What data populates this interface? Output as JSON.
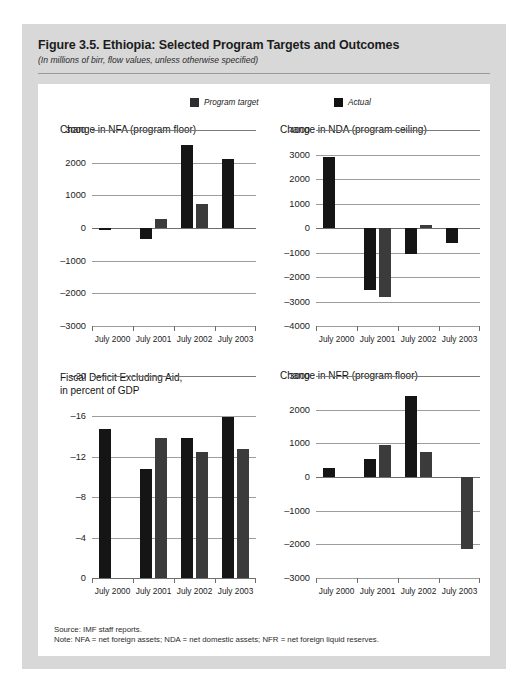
{
  "figure": {
    "title": "Figure 3.5. Ethiopia: Selected Program Targets and Outcomes",
    "subtitle": "(In millions of birr, flow values, unless otherwise specified)",
    "source_note": "Source: IMF staff reports.",
    "definition_note": "Note: NFA = net foreign assets; NDA = net domestic assets; NFR = net foreign liquid reserves."
  },
  "legend": {
    "target_label": "Program target",
    "actual_label": "Actual",
    "target_color": "#2e2e2e",
    "actual_color": "#111111"
  },
  "categories": [
    "July 2000",
    "July 2001",
    "July 2002",
    "July 2003"
  ],
  "chart_data": [
    {
      "id": "nfa",
      "type": "bar",
      "title": "Change in NFA (program floor)",
      "xlabel": "",
      "ylabel": "",
      "ylim": [
        -3000,
        3000
      ],
      "yticks": [
        3000,
        2000,
        1000,
        0,
        -1000,
        -2000,
        -3000
      ],
      "ytick_labels": [
        "3000",
        "2000",
        "1000",
        "0",
        "–1000",
        "–2000",
        "–3000"
      ],
      "grid": true,
      "legend_position": "top",
      "categories": [
        "July 2000",
        "July 2001",
        "July 2002",
        "July 2003"
      ],
      "series": [
        {
          "name": "Program target",
          "values": [
            -30,
            -330,
            2550,
            2100
          ]
        },
        {
          "name": "Actual",
          "values": [
            null,
            270,
            720,
            null
          ]
        }
      ]
    },
    {
      "id": "nda",
      "type": "bar",
      "title": "Change in NDA (program ceiling)",
      "xlabel": "",
      "ylabel": "",
      "ylim": [
        -4000,
        4000
      ],
      "yticks": [
        4000,
        3000,
        2000,
        1000,
        0,
        -1000,
        -2000,
        -3000,
        -4000
      ],
      "ytick_labels": [
        "4000",
        "3000",
        "2000",
        "1000",
        "0",
        "–1000",
        "–2000",
        "–3000",
        "–4000"
      ],
      "grid": true,
      "legend_position": "top",
      "categories": [
        "July 2000",
        "July 2001",
        "July 2002",
        "July 2003"
      ],
      "series": [
        {
          "name": "Program target",
          "values": [
            2880,
            -2520,
            -1050,
            -610
          ]
        },
        {
          "name": "Actual",
          "values": [
            null,
            -2800,
            110,
            null
          ]
        }
      ]
    },
    {
      "id": "fiscal-deficit",
      "type": "bar",
      "title": "Fiscal Deficit Excluding Aid,\nin percent of GDP",
      "xlabel": "",
      "ylabel": "",
      "ylim": [
        0,
        -20
      ],
      "yticks": [
        -20,
        -16,
        -12,
        -8,
        -4,
        0
      ],
      "ytick_labels": [
        "–20",
        "–16",
        "–12",
        "–8",
        "–4",
        "0"
      ],
      "grid": true,
      "legend_position": "top",
      "categories": [
        "July 2000",
        "July 2001",
        "July 2002",
        "July 2003"
      ],
      "series": [
        {
          "name": "Program target",
          "values": [
            -14.8,
            -10.8,
            -13.9,
            -15.9
          ]
        },
        {
          "name": "Actual",
          "values": [
            null,
            -13.9,
            -12.5,
            -12.8
          ]
        }
      ]
    },
    {
      "id": "nfr",
      "type": "bar",
      "title": "Change in NFR (program floor)",
      "xlabel": "",
      "ylabel": "",
      "ylim": [
        -3000,
        3000
      ],
      "yticks": [
        3000,
        2000,
        1000,
        0,
        -1000,
        -2000,
        -3000
      ],
      "ytick_labels": [
        "3000",
        "2000",
        "1000",
        "0",
        "–1000",
        "–2000",
        "–3000"
      ],
      "grid": true,
      "legend_position": "top",
      "categories": [
        "July 2000",
        "July 2001",
        "July 2002",
        "July 2003"
      ],
      "series": [
        {
          "name": "Program target",
          "values": [
            270,
            540,
            2400,
            null
          ]
        },
        {
          "name": "Actual",
          "values": [
            null,
            960,
            730,
            -2150
          ]
        }
      ]
    }
  ]
}
